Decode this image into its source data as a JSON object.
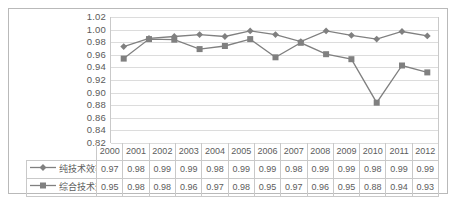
{
  "chart_data": {
    "type": "line",
    "title": "",
    "xlabel": "",
    "ylabel": "",
    "ylim": [
      0.82,
      1.02
    ],
    "ytick_step": 0.02,
    "grid": true,
    "legend_position": "data-table-left",
    "categories": [
      "2000",
      "2001",
      "2002",
      "2003",
      "2004",
      "2005",
      "2006",
      "2007",
      "2008",
      "2009",
      "2010",
      "2011",
      "2012"
    ],
    "yticks": [
      "1.02",
      "1.00",
      "0.98",
      "0.96",
      "0.94",
      "0.92",
      "0.90",
      "0.88",
      "0.86",
      "0.84",
      "0.82"
    ],
    "series": [
      {
        "name": "纯技术效率",
        "marker": "diamond",
        "color": "#808080",
        "labels": [
          "0.97",
          "0.98",
          "0.99",
          "0.99",
          "0.98",
          "0.99",
          "0.99",
          "0.98",
          "0.99",
          "0.99",
          "0.98",
          "0.99",
          "0.99"
        ],
        "values": [
          0.973,
          0.986,
          0.989,
          0.992,
          0.989,
          0.998,
          0.992,
          0.981,
          0.998,
          0.991,
          0.985,
          0.997,
          0.99
        ]
      },
      {
        "name": "综合技术效率",
        "marker": "square",
        "color": "#808080",
        "labels": [
          "0.95",
          "0.98",
          "0.98",
          "0.96",
          "0.97",
          "0.98",
          "0.95",
          "0.97",
          "0.96",
          "0.95",
          "0.88",
          "0.94",
          "0.93"
        ],
        "values": [
          0.954,
          0.985,
          0.984,
          0.969,
          0.974,
          0.985,
          0.956,
          0.979,
          0.961,
          0.953,
          0.884,
          0.943,
          0.932
        ]
      }
    ]
  },
  "caption": ""
}
